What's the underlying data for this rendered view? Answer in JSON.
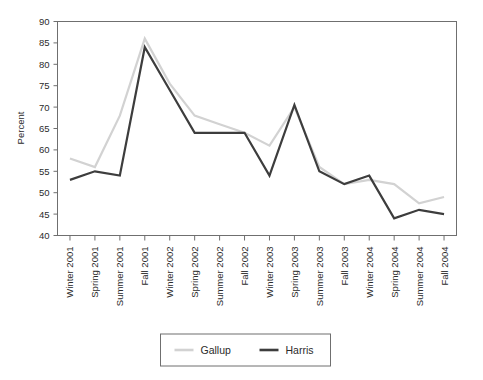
{
  "chart_data": {
    "type": "line",
    "title": "",
    "xlabel": "",
    "ylabel": "Percent",
    "ylim": [
      40,
      90
    ],
    "ytick_values": [
      40,
      45,
      50,
      55,
      60,
      65,
      70,
      75,
      80,
      85,
      90
    ],
    "ytick_labels": [
      "40",
      "45",
      "50",
      "55",
      "60",
      "65",
      "70",
      "75",
      "80",
      "85",
      "90"
    ],
    "grid": false,
    "legend_position": "bottom-center",
    "categories": [
      "Winter 2001",
      "Spring 2001",
      "Summer 2001",
      "Fall 2001",
      "Winter 2002",
      "Spring 2002",
      "Summer 2002",
      "Fall 2002",
      "Winter 2003",
      "Spring 2003",
      "Summer 2003",
      "Fall 2003",
      "Winter 2004",
      "Spring 2004",
      "Summer 2004",
      "Fall 2004"
    ],
    "series": [
      {
        "name": "Gallup",
        "color": "#d2d2d2",
        "values": [
          58,
          56,
          68,
          86,
          75.5,
          68,
          66,
          64,
          61,
          70,
          56,
          52,
          53,
          52,
          47.5,
          49
        ]
      },
      {
        "name": "Harris",
        "color": "#3d3d3d",
        "values": [
          53,
          55,
          54,
          84,
          74,
          64,
          64,
          64,
          54,
          70.5,
          55,
          52,
          54,
          44,
          46,
          45
        ]
      }
    ]
  },
  "legend": {
    "entries": [
      {
        "label": "Gallup"
      },
      {
        "label": "Harris"
      }
    ]
  },
  "axes": {
    "y_title": "Percent"
  }
}
